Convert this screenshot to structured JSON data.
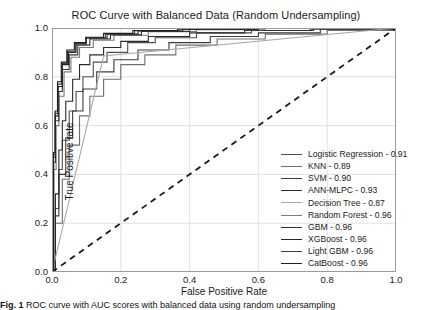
{
  "figure": {
    "caption_prefix": "Fig. 1",
    "caption_text": "ROC curve with AUC scores with balanced data using random undersampling"
  },
  "chart_data": {
    "type": "line",
    "title": "ROC Curve with Balanced Data (Random Undersampling)",
    "xlabel": "False Positive Rate",
    "ylabel": "True Positive rate",
    "xlim": [
      0.0,
      1.0
    ],
    "ylim": [
      0.0,
      1.0
    ],
    "xticks": [
      "0.0",
      "0.2",
      "0.4",
      "0.6",
      "0.8",
      "1.0"
    ],
    "xtick_values": [
      0.0,
      0.2,
      0.4,
      0.6,
      0.8,
      1.0
    ],
    "yticks": [
      "0.0",
      "0.2",
      "0.4",
      "0.6",
      "0.8",
      "1.0"
    ],
    "ytick_values": [
      0.0,
      0.2,
      0.4,
      0.6,
      0.8,
      1.0
    ],
    "grid": true,
    "legend_position": "lower right",
    "reference_line": {
      "name": "chance-diagonal",
      "style": "dashed",
      "color": "#1a1a1a",
      "x": [
        0.0,
        1.0
      ],
      "y": [
        0.0,
        1.0
      ]
    },
    "series": [
      {
        "name": "Logistic Regression",
        "auc": "0.91",
        "legend_label": "Logistic Regression - 0.91",
        "color": "#4f4f4f",
        "x": [
          0.0,
          0.01,
          0.02,
          0.03,
          0.05,
          0.07,
          0.09,
          0.12,
          0.16,
          0.22,
          0.3,
          0.42,
          0.58,
          0.75,
          1.0
        ],
        "y": [
          0.0,
          0.26,
          0.42,
          0.54,
          0.66,
          0.74,
          0.8,
          0.86,
          0.9,
          0.94,
          0.96,
          0.98,
          0.99,
          0.995,
          1.0
        ]
      },
      {
        "name": "KNN",
        "auc": "0.89",
        "legend_label": "KNN - 0.89",
        "color": "#6e6e6e",
        "x": [
          0.0,
          0.01,
          0.03,
          0.05,
          0.08,
          0.11,
          0.15,
          0.2,
          0.27,
          0.36,
          0.48,
          0.62,
          0.8,
          1.0
        ],
        "y": [
          0.0,
          0.2,
          0.38,
          0.52,
          0.64,
          0.72,
          0.79,
          0.85,
          0.89,
          0.93,
          0.955,
          0.975,
          0.99,
          1.0
        ]
      },
      {
        "name": "SVM",
        "auc": "0.90",
        "legend_label": "SVM - 0.90",
        "color": "#3b3b3b",
        "x": [
          0.0,
          0.01,
          0.02,
          0.04,
          0.06,
          0.09,
          0.13,
          0.18,
          0.25,
          0.34,
          0.46,
          0.6,
          0.78,
          1.0
        ],
        "y": [
          0.0,
          0.23,
          0.4,
          0.55,
          0.66,
          0.75,
          0.82,
          0.87,
          0.91,
          0.94,
          0.965,
          0.98,
          0.995,
          1.0
        ]
      },
      {
        "name": "ANN-MLPC",
        "auc": "0.93",
        "legend_label": "ANN-MLPC - 0.93",
        "color": "#2b2b2b",
        "x": [
          0.0,
          0.01,
          0.02,
          0.03,
          0.04,
          0.06,
          0.08,
          0.11,
          0.15,
          0.2,
          0.28,
          0.4,
          0.56,
          0.76,
          1.0
        ],
        "y": [
          0.0,
          0.32,
          0.5,
          0.62,
          0.7,
          0.79,
          0.85,
          0.89,
          0.92,
          0.945,
          0.965,
          0.98,
          0.99,
          0.997,
          1.0
        ]
      },
      {
        "name": "Decision Tree",
        "auc": "0.87",
        "legend_label": "Decision Tree - 0.87",
        "color": "#a8a8a8",
        "x": [
          0.0,
          0.15,
          1.0
        ],
        "y": [
          0.0,
          0.885,
          1.0
        ]
      },
      {
        "name": "Random Forest",
        "auc": "0.96",
        "legend_label": "Random Forest - 0.96",
        "color": "#7a7a7a",
        "x": [
          0.0,
          0.005,
          0.012,
          0.02,
          0.035,
          0.055,
          0.08,
          0.12,
          0.18,
          0.28,
          0.42,
          0.62,
          1.0
        ],
        "y": [
          0.0,
          0.42,
          0.6,
          0.72,
          0.82,
          0.88,
          0.92,
          0.95,
          0.97,
          0.985,
          0.993,
          0.998,
          1.0
        ]
      },
      {
        "name": "GBM",
        "auc": "0.96",
        "legend_label": "GBM - 0.96",
        "color": "#333333",
        "x": [
          0.0,
          0.005,
          0.01,
          0.02,
          0.03,
          0.05,
          0.075,
          0.11,
          0.17,
          0.26,
          0.4,
          0.6,
          1.0
        ],
        "y": [
          0.0,
          0.45,
          0.62,
          0.74,
          0.83,
          0.89,
          0.93,
          0.955,
          0.972,
          0.986,
          0.994,
          0.998,
          1.0
        ]
      },
      {
        "name": "XGBoost",
        "auc": "0.96",
        "legend_label": "XGBoost - 0.96",
        "color": "#262626",
        "x": [
          0.0,
          0.004,
          0.01,
          0.018,
          0.03,
          0.048,
          0.07,
          0.1,
          0.16,
          0.25,
          0.38,
          0.58,
          1.0
        ],
        "y": [
          0.0,
          0.47,
          0.64,
          0.76,
          0.85,
          0.9,
          0.935,
          0.958,
          0.975,
          0.988,
          0.995,
          0.999,
          1.0
        ]
      },
      {
        "name": "Light GBM",
        "auc": "0.96",
        "legend_label": "Light GBM - 0.96",
        "color": "#404040",
        "x": [
          0.0,
          0.004,
          0.009,
          0.017,
          0.028,
          0.045,
          0.068,
          0.1,
          0.155,
          0.24,
          0.37,
          0.57,
          1.0
        ],
        "y": [
          0.0,
          0.48,
          0.65,
          0.77,
          0.855,
          0.905,
          0.938,
          0.96,
          0.976,
          0.989,
          0.996,
          0.999,
          1.0
        ]
      },
      {
        "name": "CatBoost",
        "auc": "0.96",
        "legend_label": "CatBoost - 0.96",
        "color": "#1f1f1f",
        "x": [
          0.0,
          0.004,
          0.009,
          0.016,
          0.027,
          0.043,
          0.065,
          0.098,
          0.15,
          0.235,
          0.365,
          0.56,
          1.0
        ],
        "y": [
          0.0,
          0.49,
          0.66,
          0.78,
          0.86,
          0.91,
          0.94,
          0.962,
          0.978,
          0.99,
          0.996,
          0.999,
          1.0
        ]
      }
    ]
  }
}
